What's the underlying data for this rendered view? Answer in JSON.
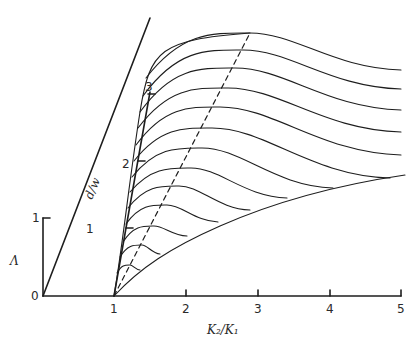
{
  "diagram": {
    "x_axis": {
      "label": "K₂/K₁",
      "ticks": [
        "1",
        "2",
        "3",
        "4",
        "5"
      ]
    },
    "lambda_axis": {
      "label": "Λ",
      "origin_label": "0",
      "ticks": [
        "1"
      ]
    },
    "dw_axis": {
      "label": "d/w",
      "ticks": [
        "1",
        "2",
        "3"
      ]
    },
    "families": {
      "curve_count": 13,
      "dashed_line": "locus of maxima",
      "right_envelope": "lower boundary curve"
    }
  },
  "layout": {
    "origin": [
      43,
      296
    ],
    "x_tick_px": [
      114,
      186,
      258,
      330,
      401
    ],
    "lambda_top": [
      43,
      218
    ],
    "left_diagonal": [
      [
        43,
        296
      ],
      [
        150,
        18
      ]
    ],
    "dw_axis_line": [
      [
        114,
        296
      ],
      [
        150,
        92
      ]
    ],
    "dw_tick_px": [
      [
        126,
        228
      ],
      [
        138,
        161
      ],
      [
        148,
        94
      ]
    ],
    "dashed": [
      [
        114,
        296
      ],
      [
        250,
        33
      ]
    ],
    "right_envelope": [
      [
        114,
        296
      ],
      [
        160,
        258
      ],
      [
        220,
        226
      ],
      [
        300,
        197
      ],
      [
        360,
        182
      ],
      [
        405,
        175
      ]
    ],
    "curves": [
      {
        "start": [
          146,
          78
        ],
        "peak": [
          250,
          33
        ],
        "end": [
          401,
          70
        ]
      },
      {
        "start": [
          143,
          96
        ],
        "peak": [
          243,
          50
        ],
        "end": [
          401,
          89
        ]
      },
      {
        "start": [
          140,
          112
        ],
        "peak": [
          235,
          68
        ],
        "end": [
          401,
          110
        ]
      },
      {
        "start": [
          138,
          128
        ],
        "peak": [
          228,
          88
        ],
        "end": [
          401,
          132
        ]
      },
      {
        "start": [
          136,
          145
        ],
        "peak": [
          220,
          107
        ],
        "end": [
          401,
          155
        ]
      },
      {
        "start": [
          134,
          161
        ],
        "peak": [
          212,
          128
        ],
        "end": [
          390,
          178
        ]
      },
      {
        "start": [
          132,
          177
        ],
        "peak": [
          202,
          148
        ],
        "end": [
          333,
          188
        ]
      },
      {
        "start": [
          130,
          192
        ],
        "peak": [
          191,
          168
        ],
        "end": [
          287,
          198
        ]
      },
      {
        "start": [
          128,
          208
        ],
        "peak": [
          179,
          186
        ],
        "end": [
          250,
          210
        ]
      },
      {
        "start": [
          126,
          224
        ],
        "peak": [
          167,
          205
        ],
        "end": [
          218,
          222
        ]
      },
      {
        "start": [
          123,
          242
        ],
        "peak": [
          154,
          226
        ],
        "end": [
          187,
          236
        ]
      },
      {
        "start": [
          120,
          257
        ],
        "peak": [
          142,
          245
        ],
        "end": [
          160,
          254
        ]
      },
      {
        "start": [
          117,
          273
        ],
        "peak": [
          130,
          265
        ],
        "end": [
          140,
          270
        ]
      }
    ]
  },
  "colors": {
    "ink": "#1e1e1e",
    "background": "#ffffff"
  }
}
